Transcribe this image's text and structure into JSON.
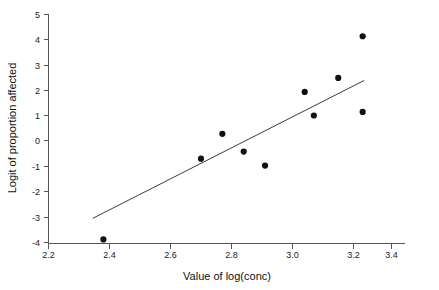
{
  "chart_data": {
    "type": "scatter",
    "title": "",
    "xlabel": "Value of log(conc)",
    "ylabel": "Logit of proportion affected",
    "xlim": [
      2.2,
      3.4
    ],
    "ylim": [
      -4,
      5
    ],
    "xticks": [
      "2.2",
      "2.4",
      "2.6",
      "2.8",
      "3.0",
      "3.2",
      "3.4"
    ],
    "xtick_values": [
      2.2,
      2.4,
      2.6,
      2.8,
      3.0,
      3.2,
      3.4
    ],
    "yticks": [
      "5",
      "4",
      "3",
      "2",
      "1",
      "0",
      "-1",
      "-2",
      "-3",
      "-4"
    ],
    "ytick_values": [
      5,
      4,
      3,
      2,
      1,
      0,
      -1,
      -2,
      -3,
      -4
    ],
    "grid": false,
    "legend": false,
    "series": [
      {
        "name": "observations",
        "marker": "filled-circle",
        "color": "#111111",
        "x": [
          2.38,
          2.7,
          2.77,
          2.84,
          2.91,
          3.04,
          3.07,
          3.15,
          3.23,
          3.23
        ],
        "y": [
          -3.88,
          -0.7,
          0.28,
          -0.42,
          -0.97,
          1.93,
          1.0,
          2.48,
          4.12,
          1.14
        ]
      },
      {
        "name": "fitted-line",
        "type": "line",
        "color": "#3d3d3d",
        "x": [
          2.345,
          3.235
        ],
        "y": [
          -3.05,
          2.38
        ]
      }
    ]
  },
  "axes": {
    "x_title": "Value of log(conc)",
    "y_title": "Logit of proportion affected"
  }
}
